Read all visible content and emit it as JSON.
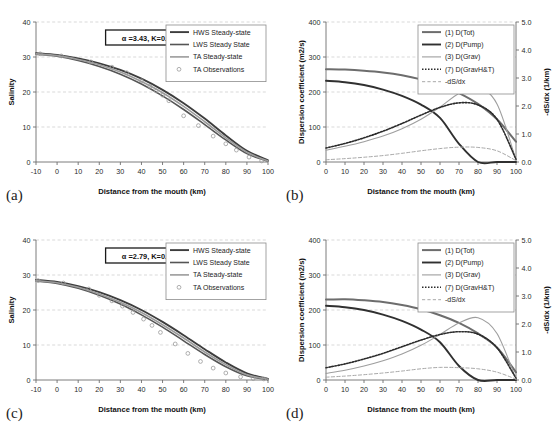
{
  "figure": {
    "width": 560,
    "height": 436,
    "panels": [
      "a",
      "b",
      "c",
      "d"
    ]
  },
  "colors": {
    "hws": "#3d3d3d",
    "lws": "#555555",
    "ta": "#9b9b9b",
    "obs": "#9a9a9a",
    "dtot": "#6d6d6d",
    "dpump": "#303030",
    "dgrav": "#9e9e9e",
    "dgravht": "#2b2b2b",
    "dsdx": "#a8a8a8",
    "grid": "#c9c9c9",
    "axis": "#6e6e6e"
  },
  "chart_data": [
    {
      "panel": "a",
      "tag": "(a)",
      "type": "line",
      "title": "",
      "xlabel": "Distance from the mouth (km)",
      "ylabel": "Salinity",
      "xlim": [
        -10,
        100
      ],
      "ylim": [
        0,
        40
      ],
      "xticks": [
        -10,
        0,
        10,
        20,
        30,
        40,
        50,
        60,
        70,
        80,
        90,
        100
      ],
      "yticks": [
        0,
        10,
        20,
        30,
        40
      ],
      "grid": true,
      "annotation": "α =3.43, K=0.25",
      "legend_position": "top-right",
      "x": [
        -10,
        0,
        10,
        20,
        30,
        40,
        50,
        60,
        70,
        80,
        90,
        100
      ],
      "series": [
        {
          "name": "HWS Steady-state",
          "style": "solid",
          "width": 1.9,
          "color_key": "hws",
          "values": [
            31.1,
            30.6,
            29.6,
            28.2,
            26.3,
            23.8,
            20.6,
            16.8,
            12.4,
            7.6,
            3.2,
            0.5
          ]
        },
        {
          "name": "LWS Steady State",
          "style": "solid",
          "width": 1.6,
          "color_key": "lws",
          "values": [
            30.8,
            30.2,
            29.0,
            27.3,
            25.1,
            22.3,
            18.9,
            15.0,
            10.7,
            6.3,
            2.4,
            0.2
          ]
        },
        {
          "name": "TA Steady-state",
          "style": "solid",
          "width": 1.6,
          "color_key": "ta",
          "values": [
            30.9,
            30.4,
            29.3,
            27.8,
            25.7,
            23.0,
            19.8,
            15.9,
            11.5,
            6.9,
            2.8,
            0.3
          ]
        }
      ],
      "observations": {
        "name": "TA Observations",
        "marker": "circle",
        "x": [
          -8,
          2,
          16,
          26,
          33,
          40,
          44,
          47,
          50,
          53,
          60,
          67,
          74,
          80,
          85,
          91,
          97
        ],
        "y": [
          30.9,
          30.3,
          28.6,
          27.1,
          25.5,
          23.2,
          21.6,
          20.3,
          19.1,
          17.5,
          13.2,
          10.4,
          7.4,
          5.2,
          3.4,
          1.4,
          0.3
        ]
      }
    },
    {
      "panel": "b",
      "tag": "(b)",
      "type": "line",
      "title": "",
      "xlabel": "Distance from the mouth (km)",
      "ylabel": "Dispersion coefficient (m2/s)",
      "ylabel_right": "-dS/dx (1/km)",
      "xlim": [
        0,
        100
      ],
      "ylim": [
        0,
        400
      ],
      "ylim_right": [
        0.0,
        5.0
      ],
      "xticks": [
        0,
        10,
        20,
        30,
        40,
        50,
        60,
        70,
        80,
        90,
        100
      ],
      "yticks": [
        0,
        100,
        200,
        300,
        400
      ],
      "yticks_right": [
        "0.0",
        "1.0",
        "2.0",
        "3.0",
        "4.0",
        "5.0"
      ],
      "grid": true,
      "legend_position": "top-right",
      "x": [
        0,
        10,
        20,
        30,
        40,
        50,
        60,
        70,
        80,
        90,
        100
      ],
      "series": [
        {
          "name": "(1) D(Tot)",
          "style": "solid",
          "width": 2.0,
          "color_key": "dtot",
          "axis": "left",
          "values": [
            265,
            264,
            261,
            256,
            248,
            236,
            220,
            197,
            166,
            122,
            58
          ]
        },
        {
          "name": "(2) D(Pump)",
          "style": "solid",
          "width": 1.9,
          "color_key": "dpump",
          "axis": "left",
          "values": [
            232,
            228,
            220,
            207,
            189,
            164,
            126,
            52,
            0,
            0,
            0
          ]
        },
        {
          "name": "(3) D(Grav)",
          "style": "solid",
          "width": 1.1,
          "color_key": "dgrav",
          "axis": "left",
          "values": [
            34,
            45,
            58,
            74,
            95,
            122,
            157,
            196,
            212,
            166,
            6
          ]
        },
        {
          "name": "(7) D(GravH&T)",
          "style": "dotted",
          "width": 1.6,
          "color_key": "dgravht",
          "axis": "left",
          "values": [
            40,
            53,
            69,
            88,
            110,
            134,
            156,
            169,
            163,
            122,
            8
          ]
        },
        {
          "name": "-dS/dx",
          "style": "dashed",
          "width": 1.0,
          "color_key": "dsdx",
          "axis": "right",
          "values": [
            0.08,
            0.12,
            0.17,
            0.23,
            0.31,
            0.4,
            0.48,
            0.53,
            0.52,
            0.4,
            0.05
          ]
        }
      ]
    },
    {
      "panel": "c",
      "tag": "(c)",
      "type": "line",
      "title": "",
      "xlabel": "Distance from the mouth (km)",
      "ylabel": "Salinity",
      "xlim": [
        -10,
        100
      ],
      "ylim": [
        0,
        40
      ],
      "xticks": [
        -10,
        0,
        10,
        20,
        30,
        40,
        50,
        60,
        70,
        80,
        90,
        100
      ],
      "yticks": [
        0,
        10,
        20,
        30,
        40
      ],
      "grid": true,
      "annotation": "α =2.79, K=0.25",
      "legend_position": "top-right",
      "x": [
        -10,
        0,
        10,
        20,
        30,
        40,
        50,
        60,
        70,
        80,
        90,
        100
      ],
      "series": [
        {
          "name": "HWS Steady-state",
          "style": "solid",
          "width": 1.9,
          "color_key": "hws",
          "values": [
            28.6,
            28.0,
            26.8,
            25.1,
            22.8,
            20.0,
            16.6,
            12.8,
            8.8,
            5.0,
            1.9,
            0.3
          ]
        },
        {
          "name": "LWS Steady State",
          "style": "solid",
          "width": 1.6,
          "color_key": "lws",
          "values": [
            28.3,
            27.6,
            26.2,
            24.2,
            21.7,
            18.6,
            15.1,
            11.2,
            7.3,
            3.8,
            1.2,
            0.1
          ]
        },
        {
          "name": "TA Steady-state",
          "style": "solid",
          "width": 1.6,
          "color_key": "ta",
          "values": [
            28.4,
            27.8,
            26.5,
            24.6,
            22.2,
            19.3,
            15.8,
            12.0,
            8.0,
            4.4,
            1.5,
            0.2
          ]
        }
      ],
      "observations": {
        "name": "TA Observations",
        "marker": "circle",
        "x": [
          -9,
          3,
          15,
          20,
          26,
          31,
          36,
          41,
          45,
          49,
          56,
          62,
          68,
          74,
          80,
          87,
          93,
          98
        ],
        "y": [
          28.4,
          27.7,
          26.0,
          24.2,
          22.6,
          21.1,
          19.3,
          17.4,
          15.6,
          13.6,
          10.3,
          7.6,
          5.3,
          3.4,
          2.0,
          0.9,
          0.4,
          0.3
        ]
      }
    },
    {
      "panel": "d",
      "tag": "(d)",
      "type": "line",
      "title": "",
      "xlabel": "Distance from the mouth (km)",
      "ylabel": "Dispersion coefficient (m2/s)",
      "ylabel_right": "-dS/dx (1/km)",
      "xlim": [
        0,
        100
      ],
      "ylim": [
        0,
        400
      ],
      "ylim_right": [
        0.0,
        5.0
      ],
      "xticks": [
        0,
        10,
        20,
        30,
        40,
        50,
        60,
        70,
        80,
        90,
        100
      ],
      "yticks": [
        0,
        100,
        200,
        300,
        400
      ],
      "yticks_right": [
        "0.0",
        "1.0",
        "2.0",
        "3.0",
        "4.0",
        "5.0"
      ],
      "grid": true,
      "legend_position": "top-right",
      "x": [
        0,
        10,
        20,
        30,
        40,
        50,
        60,
        70,
        80,
        90,
        100
      ],
      "series": [
        {
          "name": "(1) D(Tot)",
          "style": "solid",
          "width": 2.0,
          "color_key": "dtot",
          "axis": "left",
          "values": [
            230,
            231,
            228,
            223,
            214,
            202,
            185,
            163,
            133,
            93,
            22
          ]
        },
        {
          "name": "(2) D(Pump)",
          "style": "solid",
          "width": 1.9,
          "color_key": "dpump",
          "axis": "left",
          "values": [
            212,
            208,
            200,
            187,
            169,
            144,
            108,
            40,
            0,
            0,
            0
          ]
        },
        {
          "name": "(3) D(Grav)",
          "style": "solid",
          "width": 1.1,
          "color_key": "dgrav",
          "axis": "left",
          "values": [
            19,
            28,
            40,
            55,
            74,
            99,
            130,
            163,
            178,
            133,
            3
          ]
        },
        {
          "name": "(7) D(GravH&T)",
          "style": "dotted",
          "width": 1.6,
          "color_key": "dgravht",
          "axis": "left",
          "values": [
            35,
            46,
            60,
            76,
            95,
            114,
            130,
            138,
            131,
            92,
            5
          ]
        },
        {
          "name": "-dS/dx",
          "style": "dashed",
          "width": 1.0,
          "color_key": "dsdx",
          "axis": "right",
          "values": [
            0.1,
            0.14,
            0.19,
            0.25,
            0.32,
            0.4,
            0.45,
            0.44,
            0.4,
            0.28,
            0.03
          ]
        }
      ]
    }
  ]
}
